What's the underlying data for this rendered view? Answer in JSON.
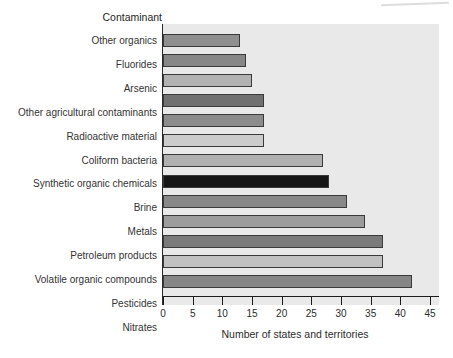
{
  "figure": {
    "title": "Contaminant",
    "xlabel": "Number of states and territories"
  },
  "chart_data": {
    "type": "bar",
    "orientation": "horizontal",
    "title": "Contaminant",
    "xlabel": "Number of states and territories",
    "xlim": [
      0,
      45
    ],
    "xticks": [
      0,
      5,
      10,
      15,
      20,
      25,
      30,
      35,
      40,
      45
    ],
    "grid": false,
    "legend": "none",
    "plot_background": "#e9e9e9",
    "bar_border_color": "#3a3a3a",
    "categories": [
      "Other organics",
      "Fluorides",
      "Arsenic",
      "Other agricultural contaminants",
      "Radioactive material",
      "Coliform bacteria",
      "Synthetic organic chemicals",
      "Brine",
      "Metals",
      "Petroleum products",
      "Volatile organic compounds",
      "Pesticides",
      "Nitrates"
    ],
    "values": [
      13,
      14,
      15,
      17,
      17,
      17,
      27,
      28,
      31,
      34,
      37,
      37,
      42
    ],
    "bar_colors": [
      "#8f8f8f",
      "#878787",
      "#b2b2b2",
      "#707070",
      "#8c8c8c",
      "#cbcbcb",
      "#b0b0b0",
      "#161616",
      "#888888",
      "#9c9c9c",
      "#7a7a7a",
      "#c1c1c1",
      "#868686"
    ]
  }
}
